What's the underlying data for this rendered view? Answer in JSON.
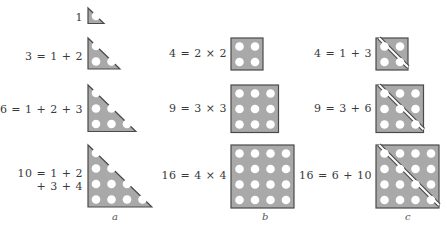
{
  "colors": {
    "fill": "#a9a9a9",
    "stroke": "#4a4a4a",
    "dot": "#ffffff",
    "text": "#3a3a3a"
  },
  "columns": [
    {
      "label": "a",
      "kind": "triangular",
      "rows": [
        {
          "equation": "1",
          "n": 1
        },
        {
          "equation": "3 = 1 + 2",
          "n": 2
        },
        {
          "equation": "6 = 1 + 2 + 3",
          "n": 3
        },
        {
          "equation_line1": "10 = 1 + 2",
          "equation_line2": "+ 3 + 4",
          "n": 4
        }
      ]
    },
    {
      "label": "b",
      "kind": "square",
      "rows": [
        {
          "equation": "4 = 2 × 2",
          "n": 2
        },
        {
          "equation": "9 = 3 × 3",
          "n": 3
        },
        {
          "equation": "16 = 4 × 4",
          "n": 4
        }
      ]
    },
    {
      "label": "c",
      "kind": "square-as-two-triangles",
      "rows": [
        {
          "equation": "4 = 1 + 3",
          "n": 2
        },
        {
          "equation": "9 = 3 + 6",
          "n": 3
        },
        {
          "equation": "16 = 6 + 10",
          "n": 4
        }
      ]
    }
  ]
}
